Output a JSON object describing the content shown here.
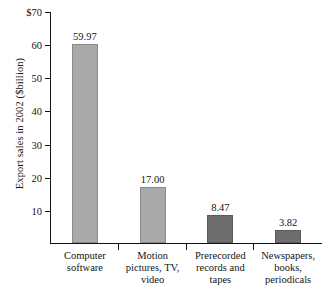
{
  "chart_data": {
    "type": "bar",
    "title": "",
    "subtitle": "",
    "xlabel": "",
    "ylabel": "Export sales in 2002 ($billion)",
    "categories": [
      "Computer software",
      "Motion pictures, TV, video",
      "Prerecorded records and tapes",
      "Newspapers, books, periodicals"
    ],
    "category_lines": [
      [
        "Computer",
        "software"
      ],
      [
        "Motion",
        "pictures, TV,",
        "video"
      ],
      [
        "Prerecorded",
        "records and",
        "tapes"
      ],
      [
        "Newspapers,",
        "books,",
        "periodicals"
      ]
    ],
    "values": [
      59.97,
      17.0,
      8.47,
      3.82
    ],
    "value_labels": [
      "59.97",
      "17.00",
      "8.47",
      "3.82"
    ],
    "ylim": [
      0,
      70
    ],
    "ytick_values": [
      10,
      20,
      30,
      40,
      50,
      60,
      70
    ],
    "ytick_labels": [
      "10",
      "20",
      "30",
      "40",
      "50",
      "60",
      "$70"
    ],
    "grid": false,
    "legend": false,
    "bar_colors": [
      "#a9a9a9",
      "#a9a9a9",
      "#6e6e6e",
      "#6e6e6e"
    ]
  },
  "axis": {
    "y_title": "Export sales in 2002 ($billion)"
  }
}
